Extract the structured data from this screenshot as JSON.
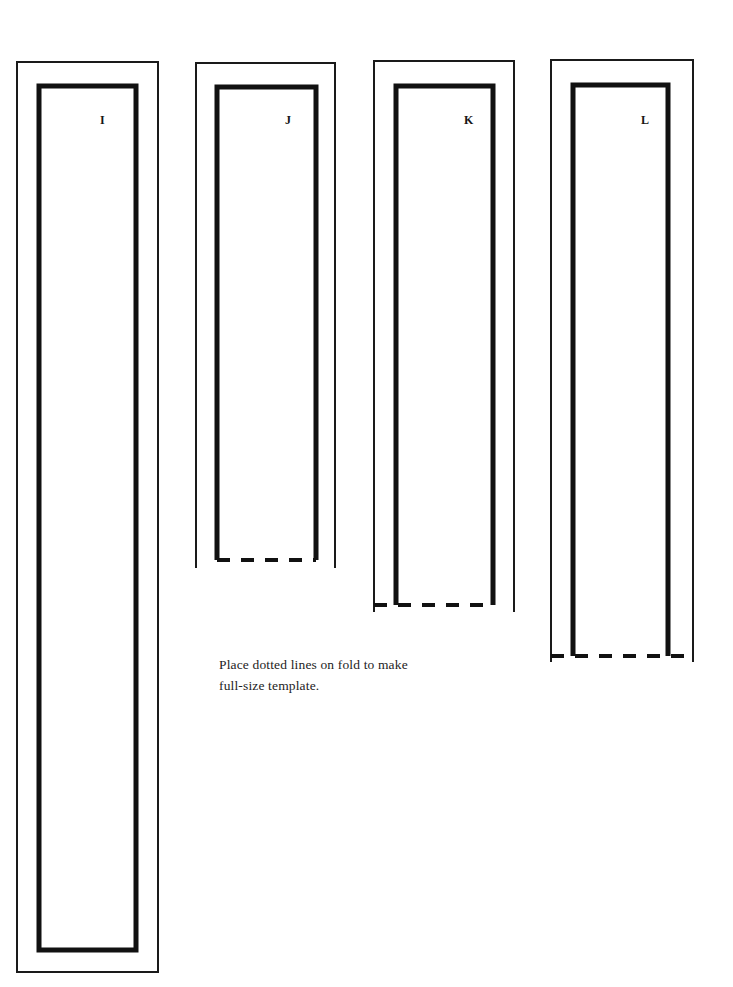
{
  "document": {
    "kind": "pattern-template-sheet",
    "background_color": "#ffffff",
    "ink_color": "#111111",
    "width": 733,
    "height": 987
  },
  "note": {
    "line1": "Place dotted lines on fold to make",
    "line2": "full-size template."
  },
  "pieces": [
    {
      "id": "I",
      "label": "I",
      "label_x": 100,
      "label_y": 114,
      "has_fold_line": false,
      "outer": {
        "x": 17,
        "y": 62,
        "width": 141,
        "height": 910
      },
      "inner": {
        "x": 39,
        "y": 86,
        "width": 97,
        "height": 864
      },
      "fold": null
    },
    {
      "id": "J",
      "label": "J",
      "label_x": 285,
      "label_y": 114,
      "has_fold_line": true,
      "outer": {
        "x": 196,
        "y": 63,
        "width": 139,
        "height": 505
      },
      "inner": {
        "x": 217,
        "y": 87,
        "width": 99,
        "height": 473
      },
      "fold": {
        "x1": 217,
        "x2": 316,
        "y": 560
      }
    },
    {
      "id": "K",
      "label": "K",
      "label_x": 464,
      "label_y": 114,
      "has_fold_line": true,
      "outer": {
        "x": 374,
        "y": 61,
        "width": 140,
        "height": 551
      },
      "inner": {
        "x": 396,
        "y": 86,
        "width": 97,
        "height": 519
      },
      "fold": {
        "x1": 374,
        "x2": 493,
        "y": 605
      }
    },
    {
      "id": "L",
      "label": "L",
      "label_x": 641,
      "label_y": 114,
      "has_fold_line": true,
      "outer": {
        "x": 551,
        "y": 60,
        "width": 142,
        "height": 602
      },
      "inner": {
        "x": 573,
        "y": 85,
        "width": 95,
        "height": 571
      },
      "fold": {
        "x1": 551,
        "x2": 693,
        "y": 656
      }
    }
  ]
}
